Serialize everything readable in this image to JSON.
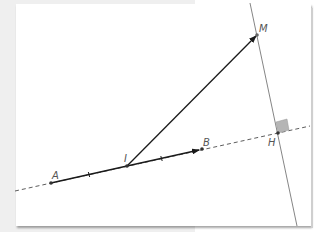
{
  "figure": {
    "type": "geometry-construction",
    "points": {
      "A": {
        "label": "A",
        "x": 51,
        "y": 183
      },
      "I": {
        "label": "I",
        "x": 127,
        "y": 166
      },
      "B": {
        "label": "B",
        "x": 202,
        "y": 149
      },
      "M": {
        "label": "M",
        "x": 257,
        "y": 35
      },
      "H": {
        "label": "H",
        "x": 278,
        "y": 133
      }
    },
    "segments": [
      {
        "name": "AI",
        "style": "solid",
        "tick_mark": "single"
      },
      {
        "name": "IB",
        "style": "vector",
        "tick_mark": "single"
      },
      {
        "name": "IM",
        "style": "vector"
      }
    ],
    "lines": [
      {
        "name": "line-AB",
        "style": "dashed"
      },
      {
        "name": "perpendicular-MH",
        "style": "solid-gray"
      }
    ],
    "right_angle_at": "H",
    "colors": {
      "stroke": "#222222",
      "construction": "#777777",
      "right_angle_fill": "#b5b5b5",
      "label": "#555555"
    }
  }
}
